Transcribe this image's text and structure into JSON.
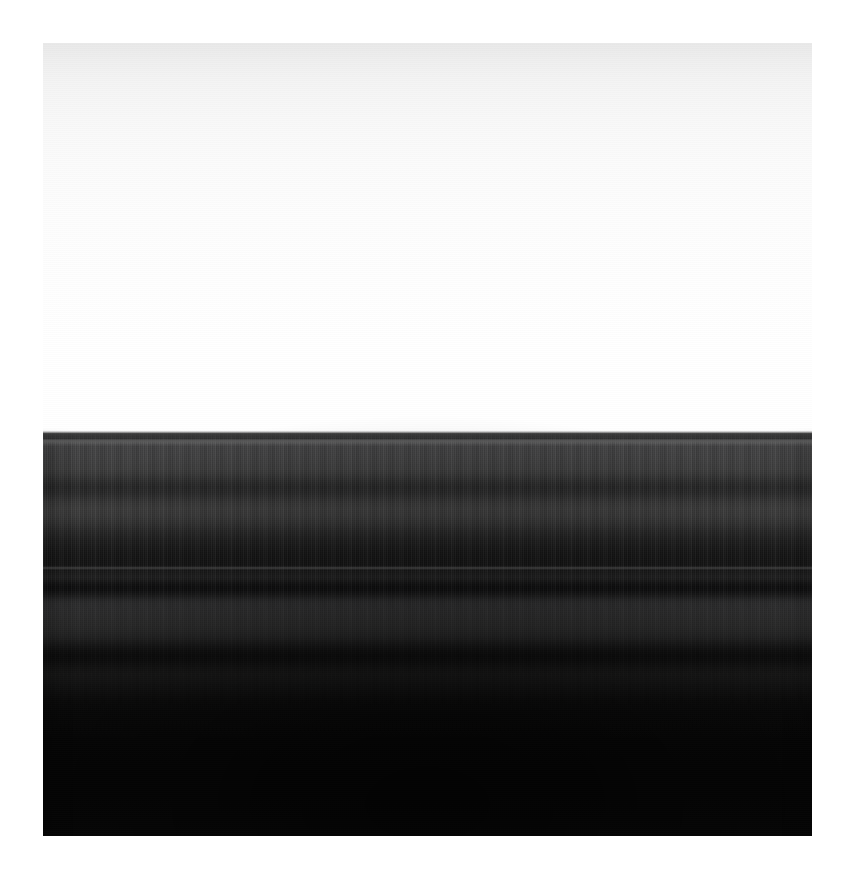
{
  "image": {
    "title": "Backlit ring-plane photograph",
    "subject": "Horizontal banded structure beneath a bright hazy sky",
    "orientation": "landscape-banded",
    "mat": {
      "background_color": "#ffffff",
      "inset_left_px": 43,
      "inset_top_px": 43,
      "plate_width_px": 769,
      "plate_height_px": 793
    },
    "regions": [
      {
        "name": "upper-sky",
        "description": "Smooth near-white gradient, slightly grey at the very top, brightening to pure white",
        "top_color": "#e9e9e9",
        "bottom_color": "#ffffff",
        "y_start_px": 0,
        "y_end_px": 385
      },
      {
        "name": "horizon-edge",
        "description": "Abrupt transition from white sky into the dark banded body",
        "color": "#3d3d3d",
        "y_start_px": 385,
        "y_end_px": 392
      },
      {
        "name": "bright-ridge",
        "description": "Narrow light-grey hairline just below the horizon edge",
        "color": "#565656",
        "y_start_px": 396,
        "y_end_px": 400
      },
      {
        "name": "upper-band",
        "description": "Broad medium-grey band with fine vertical striation",
        "color": "#3a3a3a",
        "y_start_px": 400,
        "y_end_px": 436
      },
      {
        "name": "first-gap",
        "description": "Darker trough separating the upper and middle bands",
        "color": "#1f1f1f",
        "y_start_px": 436,
        "y_end_px": 452
      },
      {
        "name": "middle-band",
        "description": "Second broad grey band, slightly dimmer than the upper band",
        "color": "#373737",
        "y_start_px": 452,
        "y_end_px": 480
      },
      {
        "name": "deep-trough",
        "description": "Dark division with a thin brighter filament through the centre",
        "color": "#101010",
        "y_start_px": 495,
        "y_end_px": 552
      },
      {
        "name": "lower-band",
        "description": "Final, dimmer grey band before the plate falls to black",
        "color": "#2e2e2e",
        "y_start_px": 552,
        "y_end_px": 600
      },
      {
        "name": "shadow-floor",
        "description": "Near-black lower half with only faint residual mottling",
        "color": "#050505",
        "y_start_px": 620,
        "y_end_px": 793
      }
    ],
    "palette": {
      "paper_white": "#ffffff",
      "sky_top_grey": "#e9e9e9",
      "horizon_grey": "#3d3d3d",
      "ridge_highlight": "#565656",
      "band_grey": "#3a3a3a",
      "trough_grey": "#1f1f1f",
      "floor_black": "#050505"
    },
    "texture": {
      "vertical_striation": "fine 1-2px vertical lines across the banded half",
      "horizontal_scanlines": "subtle 1px alternating rows across the whole plate",
      "vignette": "soft darkening toward the bottom edge"
    }
  }
}
